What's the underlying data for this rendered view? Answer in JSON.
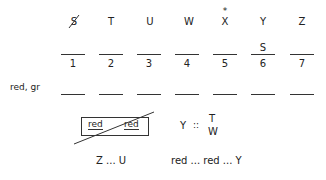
{
  "letters": [
    "S",
    "T",
    "U",
    "W",
    "X",
    "Y",
    "Z"
  ],
  "crossed_letter_index": 0,
  "star_marker": {
    "symbol": "*",
    "over_index": 4
  },
  "slot_labels": [
    "",
    "",
    "",
    "",
    "",
    "S",
    ""
  ],
  "numbers": [
    "1",
    "2",
    "3",
    "4",
    "5",
    "6",
    "7"
  ],
  "row_label": "red, gr",
  "box": {
    "left": "red",
    "right": "red"
  },
  "rule": {
    "lhs": "Y",
    "op": "::",
    "top": "T",
    "bottom": "W"
  },
  "bottom": {
    "left": "Z ... U",
    "right": "red ... red ... Y"
  }
}
